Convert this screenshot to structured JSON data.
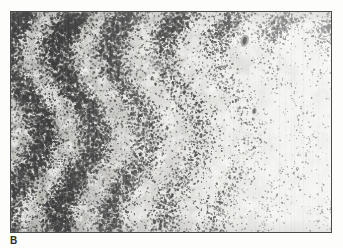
{
  "figure": {
    "panel_label": "B",
    "frame": {
      "x": 10,
      "y": 11,
      "width": 322,
      "height": 222,
      "border_color": "#4a4a4a",
      "border_width_px": 1
    },
    "page_background": "#fdfdfc",
    "label_color": "#2b2b2b"
  },
  "micrograph": {
    "modality": "brightfield-histology",
    "stain_appearance": "grayscale",
    "background_tone": "#f4f3f1",
    "nucleus_color": "#3a3a3a",
    "stroma_color": "#b9b9b6",
    "pale_field_color": "#f7f7f5",
    "striation_color": "#e2e2df",
    "zones": [
      {
        "name": "dense-cellular-zone",
        "position": "left",
        "x_start_pct": 0,
        "x_end_pct": 34,
        "cell_density": "high",
        "mean_tone": "#c9c8c5",
        "description": "Densely packed darkly stained nuclei forming a confluent sheet"
      },
      {
        "name": "transition-zone",
        "position": "center",
        "x_start_pct": 34,
        "x_end_pct": 66,
        "cell_density": "moderate",
        "mean_tone": "#e8e7e4",
        "description": "Scattered discrete dark nuclei dispersed over a pale matrix"
      },
      {
        "name": "pale-hypocellular-zone",
        "position": "right",
        "x_start_pct": 66,
        "x_end_pct": 100,
        "cell_density": "low",
        "mean_tone": "#f6f6f4",
        "description": "Pale, nearly acellular hyalinized field with fine vertical striations and rare nuclei"
      }
    ],
    "features": [
      {
        "name": "dense-nuclei-band-top",
        "x_pct": 50,
        "y_pct": 5,
        "description": "Band of increased nuclear density along the upper margin"
      },
      {
        "name": "dark-focus",
        "x_pct": 73,
        "y_pct": 13,
        "description": "Prominent dark pigment focus"
      },
      {
        "name": "dark-focus-secondary",
        "x_pct": 76,
        "y_pct": 45,
        "description": "Smaller dark pigment focus"
      }
    ]
  }
}
